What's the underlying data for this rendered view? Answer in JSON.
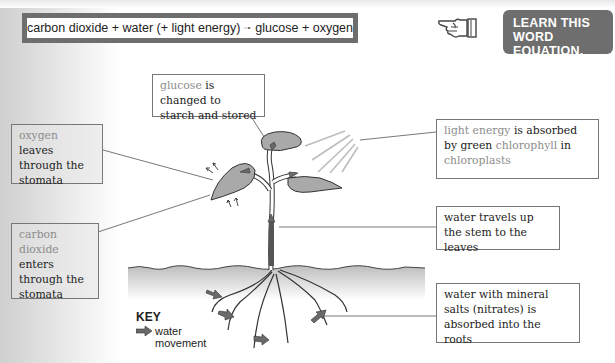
{
  "equation": {
    "reactants": "carbon dioxide + water (+ light energy)",
    "arrow": "arrow-right",
    "products": "glucose + oxygen"
  },
  "callout": {
    "icon": "pointing-hand-icon",
    "line1": "LEARN THIS",
    "line2": "WORD EQUATION."
  },
  "labels": {
    "glucose": {
      "highlight": "glucose",
      "text": " is changed to starch and stored"
    },
    "oxygen": {
      "highlight": "oxygen",
      "text": " leaves through the stomata"
    },
    "light": {
      "highlight1": "light energy",
      "text1": " is absorbed by green ",
      "highlight2": "chlorophyll",
      "text2": " in ",
      "highlight3": "chloroplasts"
    },
    "water_stem": {
      "text": "water travels up the stem to the leaves"
    },
    "carbon": {
      "highlight": "carbon dioxide",
      "text": " enters through the stomata"
    },
    "roots": {
      "text": "water with mineral salts (nitrates) is absorbed into the roots"
    }
  },
  "key": {
    "title": "KEY",
    "icon": "water-movement-arrow-icon",
    "label_line1": "water",
    "label_line2": "movement"
  },
  "colors": {
    "frame": "#6e6e6e",
    "highlight_text": "#8c8c8c",
    "leaf_fill": "#a9a9a9",
    "arrow_fill": "#6a6a6a"
  }
}
